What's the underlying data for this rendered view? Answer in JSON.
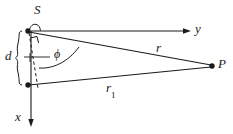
{
  "figure": {
    "type": "physics-geometry-diagram",
    "stroke_color": "#1a1a1a",
    "background_color": "#ffffff",
    "labels": {
      "source": "S",
      "y_axis": "y",
      "x_axis": "x",
      "ray_upper": "r",
      "ray_lower_base": "r",
      "ray_lower_subscript": "1",
      "point": "P",
      "angle": "ϕ",
      "separation": "d"
    },
    "points": {
      "upper_source": {
        "x": 28,
        "y": 31
      },
      "lower_source": {
        "x": 28,
        "y": 85
      },
      "field_point": {
        "x": 212,
        "y": 66
      }
    },
    "axes": {
      "origin": {
        "x": 31,
        "y": 31
      },
      "y_axis_end": {
        "x": 191,
        "y": 31
      },
      "x_axis_end": {
        "x": 31,
        "y": 126
      }
    }
  }
}
